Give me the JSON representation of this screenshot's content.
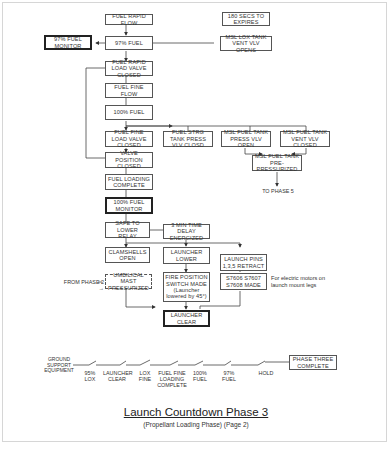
{
  "title": "Launch Countdown Phase 3",
  "subtitle": "(Propellant Loading Phase) (Page 2)",
  "boxes": {
    "fuel_rapid_flow": "FUEL RAPID FLOW",
    "secs_180": "180 SECS TO EXPIRES",
    "fuel_97": "97% FUEL",
    "monitor_97": "97% FUEL MONITOR",
    "msl_lox_vent": "MSL LOX TANK VENT VLV OPENS",
    "rapid_load_closed": "FUEL RAPID LOAD VALVE CLOSED",
    "fine_flow": "FUEL FINE FLOW",
    "fuel_100": "100% FUEL",
    "fine_load_closed": "FUEL FINE LOAD VALVE CLOSED",
    "strg_tank_press": "FUEL STRG TANK PRESS VLV CLOSD",
    "msl_press_open": "MSL FUEL TANK PRESS VLV OPEN",
    "msl_vent_closed": "MSL FUEL TANK VENT VLV CLOSED",
    "msl_prepress": "MSL FUEL TANK PRE-PRESSURIZED",
    "valve_pos_closed": "VALVE POSITION CLOSED",
    "loading_complete": "FUEL LOADING COMPLETE",
    "monitor_100": "100% FUEL MONITOR",
    "safe_lower": "SAFE TO LOWER RELAY",
    "time_delay": "3 MIN TIME DELAY ENERGIZED",
    "clamshells": "CLAMSHELLS OPEN",
    "launcher_lower": "LAUNCHER LOWER",
    "launch_pins": "LAUNCH PINS 1,3,5 RETRACT",
    "umbilical": "UMBILICAL MAST PRESSURIZED",
    "fire_position_line1": "FIRE POSITION SWITCH MADE",
    "fire_position_line2": "(Launcher lowered by 45°)",
    "s7606": "S7606 S7607 S7608 MADE",
    "launcher_clear": "LAUNCHER CLEAR",
    "phase_three_complete": "PHASE THREE COMPLETE"
  },
  "labels": {
    "to_phase_5": "TO PHASE 5",
    "from_phase_2": "FROM PHASE 2",
    "electric_note": "For electric motors on launch mount legs"
  },
  "switch_line": {
    "start": "GROUND SUPPORT EQUIPMENT",
    "contacts": [
      "95% LOX",
      "LAUNCHER CLEAR",
      "LOX FINE",
      "FUEL FINE LOADING COMPLETE",
      "100% FUEL",
      "97% FUEL",
      "HOLD"
    ]
  }
}
